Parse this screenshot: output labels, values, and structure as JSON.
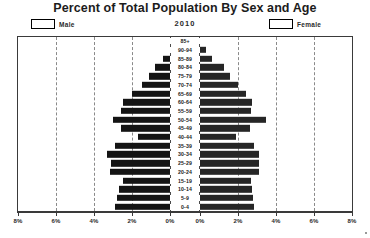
{
  "title": "Percent of Total Population By Sex and Age",
  "year": "2010",
  "legend": {
    "male": "Male",
    "female": "Female"
  },
  "axis": {
    "ticks": [
      "8%",
      "6%",
      "4%",
      "2%",
      "0%",
      "0%",
      "2%",
      "4%",
      "6%",
      "8%"
    ]
  },
  "chart_data": {
    "type": "bar",
    "subtype": "population-pyramid",
    "title": "Percent of Total Population By Sex and Age",
    "subtitle": "2010",
    "xlabel": "",
    "ylabel": "",
    "xlim": [
      0,
      8
    ],
    "xunit": "percent",
    "xticks": [
      0,
      2,
      4,
      6,
      8
    ],
    "xtick_labels": [
      "0%",
      "2%",
      "4%",
      "6%",
      "8%"
    ],
    "grid": true,
    "grid_style": "dashed-vertical",
    "legend_position": "top",
    "orientation": "horizontal-mirrored",
    "categories": [
      "85+",
      "90-94",
      "85-89",
      "80-84",
      "75-79",
      "70-74",
      "65-69",
      "60-64",
      "55-59",
      "50-54",
      "45-49",
      "40-44",
      "35-39",
      "30-34",
      "25-29",
      "20-24",
      "15-19",
      "10-14",
      "5-9",
      "0-4"
    ],
    "series": [
      {
        "name": "Male",
        "direction": "left",
        "values": [
          0.0,
          0.0,
          0.35,
          0.8,
          1.1,
          1.5,
          2.0,
          2.5,
          2.6,
          3.0,
          2.6,
          1.7,
          2.9,
          3.3,
          3.1,
          3.15,
          2.5,
          2.7,
          2.8,
          2.9
        ]
      },
      {
        "name": "Female",
        "direction": "right",
        "values": [
          0.0,
          0.3,
          0.65,
          1.25,
          1.6,
          2.0,
          2.4,
          2.75,
          2.7,
          3.45,
          2.65,
          1.9,
          2.85,
          3.1,
          3.1,
          3.1,
          2.7,
          2.75,
          2.8,
          2.85
        ]
      }
    ]
  },
  "colors": {
    "male_bar": "#141414",
    "female_bar": "#262626",
    "frame": "#3a3a3a",
    "grid": "#8a8a8a",
    "background": "#ffffff"
  }
}
